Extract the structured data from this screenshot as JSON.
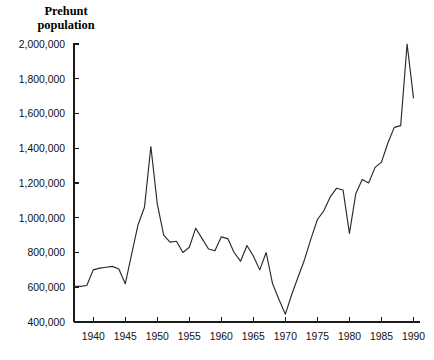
{
  "chart_data": {
    "type": "line",
    "title": "",
    "ylabel": "Prehunt population",
    "xlabel": "",
    "xlim": [
      1937,
      1990
    ],
    "ylim": [
      400000,
      2000000
    ],
    "grid": false,
    "legend": null,
    "ytick_labels": [
      "2,000,000",
      "1,800,000",
      "1,600,000",
      "1,400,000",
      "1,200,000",
      "1,000,000",
      "800,000",
      "600,000",
      "400,000"
    ],
    "ytick_values": [
      2000000,
      1800000,
      1600000,
      1400000,
      1200000,
      1000000,
      800000,
      600000,
      400000
    ],
    "xtick_labels": [
      "1940",
      "1945",
      "1950",
      "1955",
      "1960",
      "1965",
      "1970",
      "1975",
      "1980",
      "1985",
      "1990"
    ],
    "xtick_values": [
      1940,
      1945,
      1950,
      1955,
      1960,
      1965,
      1970,
      1975,
      1980,
      1985,
      1990
    ],
    "series": [
      {
        "name": "Prehunt population",
        "x": [
          1937,
          1938,
          1939,
          1940,
          1941,
          1942,
          1943,
          1944,
          1945,
          1946,
          1947,
          1948,
          1949,
          1950,
          1951,
          1952,
          1953,
          1954,
          1955,
          1956,
          1957,
          1958,
          1959,
          1960,
          1961,
          1962,
          1963,
          1964,
          1965,
          1966,
          1967,
          1968,
          1969,
          1970,
          1971,
          1972,
          1973,
          1974,
          1975,
          1976,
          1977,
          1978,
          1979,
          1980,
          1981,
          1982,
          1983,
          1984,
          1985,
          1986,
          1987,
          1988,
          1989,
          1990
        ],
        "values": [
          605000,
          605000,
          610000,
          700000,
          710000,
          715000,
          720000,
          705000,
          620000,
          790000,
          960000,
          1060000,
          1410000,
          1080000,
          900000,
          860000,
          865000,
          800000,
          830000,
          940000,
          880000,
          820000,
          810000,
          890000,
          880000,
          800000,
          750000,
          840000,
          780000,
          700000,
          800000,
          620000,
          530000,
          445000,
          560000,
          660000,
          760000,
          880000,
          990000,
          1040000,
          1120000,
          1170000,
          1160000,
          910000,
          1140000,
          1220000,
          1200000,
          1290000,
          1320000,
          1430000,
          1520000,
          1530000,
          2000000,
          1690000
        ]
      }
    ]
  },
  "axis_titles": {
    "y_line1": "Prehunt",
    "y_line2": "population"
  },
  "colors": {
    "line": "#2a2a2a",
    "axis": "#1a1a1a",
    "background": "#ffffff"
  }
}
